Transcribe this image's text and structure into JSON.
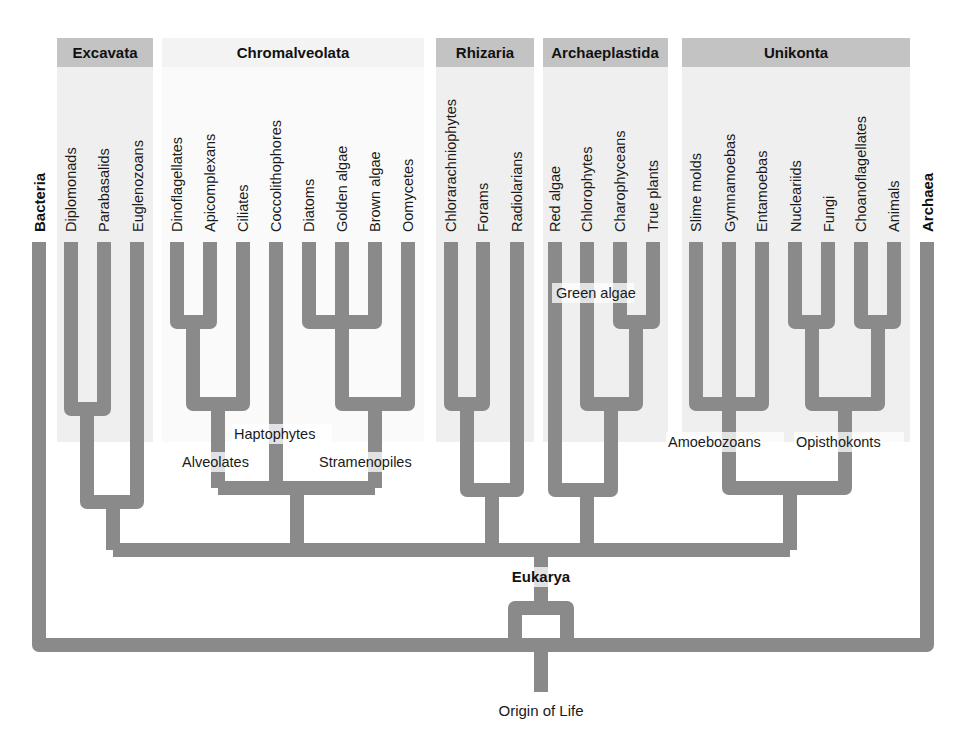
{
  "diagram": {
    "type": "phylogenetic-tree",
    "root_label": "Origin of Life",
    "domains": {
      "bacteria": "Bacteria",
      "archaea": "Archaea",
      "eukarya": "Eukarya"
    },
    "supergroups": [
      {
        "id": "excavata",
        "name": "Excavata",
        "shade": "dark",
        "members": [
          "Diplomonads",
          "Parabasalids",
          "Euglenozoans"
        ]
      },
      {
        "id": "chromalveolata",
        "name": "Chromalveolata",
        "shade": "light",
        "members": [
          "Dinoflagellates",
          "Apicomplexans",
          "Ciliates",
          "Coccolithophores",
          "Diatoms",
          "Golden algae",
          "Brown algae",
          "Oomycetes"
        ]
      },
      {
        "id": "rhizaria",
        "name": "Rhizaria",
        "shade": "dark",
        "members": [
          "Chlorarachniophytes",
          "Forams",
          "Radiolarians"
        ]
      },
      {
        "id": "archaeplastida",
        "name": "Archaeplastida",
        "shade": "dark",
        "members": [
          "Red algae",
          "Chlorophytes",
          "Charophyceans",
          "True plants"
        ]
      },
      {
        "id": "unikonta",
        "name": "Unikonta",
        "shade": "dark",
        "members": [
          "Slime molds",
          "Gymnamoebas",
          "Entamoebas",
          "Nucleariids",
          "Fungi",
          "Choanoflagellates",
          "Animals"
        ]
      }
    ],
    "clade_labels": {
      "haptophytes": "Haptophytes",
      "alveolates": "Alveolates",
      "stramenopiles": "Stramenopiles",
      "green_algae": "Green algae",
      "amoebozoans": "Amoebozoans",
      "opisthokonts": "Opisthokonts"
    },
    "colors": {
      "branch": "#8a8a8a",
      "band_dark": "#c3c3c3",
      "band_body": "#efefef",
      "band_light": "#f3f3f3"
    }
  }
}
